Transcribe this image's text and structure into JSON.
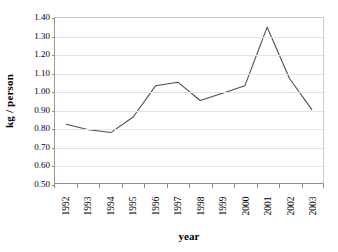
{
  "chart_data": {
    "type": "line",
    "title": "",
    "subtitle": "",
    "xlabel": "year",
    "ylabel": "kg / person",
    "categories": [
      "1992",
      "1993",
      "1994",
      "1995",
      "1996",
      "1997",
      "1998",
      "1999",
      "2000",
      "2001",
      "2002",
      "2003"
    ],
    "values": [
      0.82,
      0.79,
      0.775,
      0.86,
      1.03,
      1.05,
      0.95,
      0.99,
      1.03,
      1.35,
      1.07,
      0.9
    ],
    "series": [
      {
        "name": "kg / person",
        "values": [
          0.82,
          0.79,
          0.775,
          0.86,
          1.03,
          1.05,
          0.95,
          0.99,
          1.03,
          1.35,
          1.07,
          0.9
        ]
      }
    ],
    "ylim": [
      0.5,
      1.4
    ],
    "ytick_step": 0.1,
    "ytick_labels": [
      "1.40",
      "1.30",
      "1.20",
      "1.10",
      "1.00",
      "0.90",
      "0.80",
      "0.70",
      "0.60",
      "0.50"
    ],
    "ytick_values": [
      1.4,
      1.3,
      1.2,
      1.1,
      1.0,
      0.9,
      0.8,
      0.7,
      0.6,
      0.5
    ],
    "grid": true,
    "grid_axis": "y",
    "legend": false,
    "legend_position": "none",
    "markers": false,
    "annotations": [],
    "colors": {
      "line": "#4d4d4d",
      "grid": "#e2e2e2",
      "axis": "#8c8c8c",
      "text": "#000000",
      "background": "#ffffff"
    }
  }
}
